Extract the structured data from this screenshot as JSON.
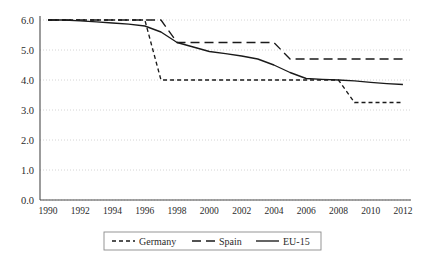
{
  "chart_data": {
    "type": "line",
    "title": "",
    "xlabel": "",
    "ylabel": "",
    "x": [
      1990,
      1991,
      1992,
      1993,
      1994,
      1995,
      1996,
      1997,
      1998,
      1999,
      2000,
      2001,
      2002,
      2003,
      2004,
      2005,
      2006,
      2007,
      2008,
      2009,
      2010,
      2011,
      2012
    ],
    "xlim": [
      1989.5,
      2012.5
    ],
    "ylim": [
      0.0,
      6.0
    ],
    "yticks": [
      0.0,
      1.0,
      2.0,
      3.0,
      4.0,
      5.0,
      6.0
    ],
    "ytick_labels": [
      "0.0",
      "1.0",
      "2.0",
      "3.0",
      "4.0",
      "5.0",
      "6.0"
    ],
    "xticks": [
      1990,
      1992,
      1994,
      1996,
      1998,
      2000,
      2002,
      2004,
      2006,
      2008,
      2010,
      2012
    ],
    "xtick_labels": [
      "1990",
      "1992",
      "1994",
      "1996",
      "1998",
      "2000",
      "2002",
      "2004",
      "2006",
      "2008",
      "2010",
      "2012"
    ],
    "grid": true,
    "grid_axis": "y",
    "legend_position": "bottom",
    "series": [
      {
        "name": "Germany",
        "style": "short-dash",
        "dash_pattern": "4 3",
        "color": "#1a1a1a",
        "values": [
          6.0,
          6.0,
          6.0,
          6.0,
          6.0,
          6.0,
          6.0,
          4.0,
          4.0,
          4.0,
          4.0,
          4.0,
          4.0,
          4.0,
          4.0,
          4.0,
          4.0,
          4.0,
          4.0,
          3.25,
          3.25,
          3.25,
          3.25
        ]
      },
      {
        "name": "Spain",
        "style": "long-dash",
        "dash_pattern": "9 5",
        "color": "#1a1a1a",
        "values": [
          6.0,
          6.0,
          6.0,
          6.0,
          6.0,
          6.0,
          6.0,
          6.0,
          5.25,
          5.25,
          5.25,
          5.25,
          5.25,
          5.25,
          5.25,
          4.7,
          4.7,
          4.7,
          4.7,
          4.7,
          4.7,
          4.7,
          4.7
        ]
      },
      {
        "name": "EU-15",
        "style": "solid",
        "dash_pattern": "",
        "color": "#1a1a1a",
        "values": [
          6.0,
          6.0,
          5.97,
          5.94,
          5.9,
          5.86,
          5.8,
          5.6,
          5.25,
          5.1,
          4.95,
          4.88,
          4.8,
          4.7,
          4.5,
          4.25,
          4.05,
          4.02,
          4.0,
          3.97,
          3.92,
          3.88,
          3.85
        ]
      }
    ],
    "legend": [
      {
        "label": "Germany",
        "style": "short-dash"
      },
      {
        "label": "Spain",
        "style": "long-dash"
      },
      {
        "label": "EU-15",
        "style": "solid"
      }
    ]
  }
}
